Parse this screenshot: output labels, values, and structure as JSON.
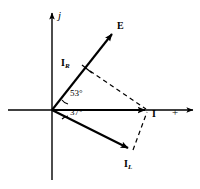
{
  "figure": {
    "background_color": "#ffffff",
    "stroke_color": "#000000"
  },
  "axes": {
    "vertical_label": "j",
    "horizontal_label": "+",
    "origin": {
      "x": 52,
      "y": 110
    },
    "vertical": {
      "x": 52,
      "y_top": 10,
      "y_bottom": 180
    },
    "horizontal": {
      "y": 110,
      "x_left": 8,
      "x_right": 196
    }
  },
  "vectors": [
    {
      "id": "E",
      "label": "E",
      "subscript": "",
      "angle_deg": 53,
      "tip": {
        "x": 115,
        "y": 30
      },
      "label_pos": {
        "x": 118,
        "y": 22
      },
      "style": "solid"
    },
    {
      "id": "IR",
      "label": "I",
      "subscript": "R",
      "angle_deg": 53,
      "tip": {
        "x": 87,
        "y": 68
      },
      "label_pos": {
        "x": 62,
        "y": 59
      },
      "style": "tick-on-E"
    },
    {
      "id": "I",
      "label": "I",
      "subscript": "",
      "angle_deg": 0,
      "tip": {
        "x": 148,
        "y": 110
      },
      "label_pos": {
        "x": 152,
        "y": 113
      },
      "style": "solid"
    },
    {
      "id": "IL",
      "label": "I",
      "subscript": "L",
      "angle_deg": -37,
      "tip": {
        "x": 131,
        "y": 152
      },
      "label_pos": {
        "x": 126,
        "y": 161
      },
      "style": "solid"
    }
  ],
  "angles": [
    {
      "id": "angle-53",
      "value": "53°",
      "label_pos": {
        "x": 70,
        "y": 93
      }
    },
    {
      "id": "angle-37",
      "value": "37°",
      "label_pos": {
        "x": 70,
        "y": 111
      }
    }
  ],
  "construction_lines": [
    {
      "id": "dash-IR-to-I",
      "from": {
        "x": 89,
        "y": 70
      },
      "to": {
        "x": 146,
        "y": 109
      },
      "style": "dashed"
    },
    {
      "id": "dash-IL-to-I",
      "from": {
        "x": 133,
        "y": 150
      },
      "to": {
        "x": 147,
        "y": 112
      },
      "style": "dashed"
    }
  ]
}
